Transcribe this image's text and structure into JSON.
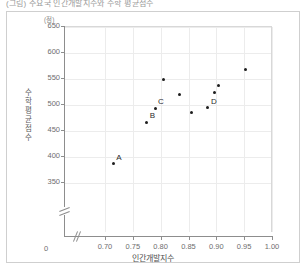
{
  "caption": "(그림) 주요국 인간개발지수와 수학 평균점수",
  "chart_data": {
    "type": "scatter",
    "title": "",
    "xlabel": "인간개발지수",
    "ylabel": "수학 평균점수",
    "yunit": "(점)",
    "xlim": [
      0.68,
      1.0
    ],
    "ylim": [
      330,
      650
    ],
    "grid": true,
    "legend": "none",
    "axis_break_x": true,
    "axis_break_y": true,
    "x_origin_label": "0",
    "xticks": [
      "0.70",
      "0.75",
      "0.80",
      "0.85",
      "0.90",
      "0.95",
      "1.00"
    ],
    "xtick_values": [
      0.7,
      0.75,
      0.8,
      0.85,
      0.9,
      0.95,
      1.0
    ],
    "yticks": [
      "650",
      "600",
      "550",
      "500",
      "450",
      "400",
      "350"
    ],
    "ytick_values": [
      650,
      600,
      550,
      500,
      450,
      400,
      350
    ],
    "points": [
      {
        "label": "A",
        "x": 0.715,
        "y": 385
      },
      {
        "label": "B",
        "x": 0.775,
        "y": 465
      },
      {
        "label": "C",
        "x": 0.79,
        "y": 492
      },
      {
        "label": "",
        "x": 0.805,
        "y": 547
      },
      {
        "label": "",
        "x": 0.833,
        "y": 518
      },
      {
        "label": "",
        "x": 0.855,
        "y": 484
      },
      {
        "label": "",
        "x": 0.897,
        "y": 523
      },
      {
        "label": "",
        "x": 0.903,
        "y": 535
      },
      {
        "label": "D",
        "x": 0.885,
        "y": 493
      },
      {
        "label": "",
        "x": 0.952,
        "y": 566
      }
    ]
  }
}
